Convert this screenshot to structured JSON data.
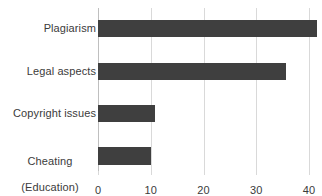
{
  "chart_data": {
    "type": "bar",
    "orientation": "horizontal",
    "title": "",
    "xlabel": "",
    "ylabel": "",
    "categories": [
      "Plagiarism",
      "Legal aspects",
      "Copyright issues",
      "Cheating\n(Education)"
    ],
    "values": [
      41.5,
      35.6,
      10.8,
      10.0
    ],
    "xlim": [
      0,
      40
    ],
    "xticks": [
      0,
      10,
      20,
      30,
      40
    ],
    "xtick_labels": [
      "0",
      "10",
      "20",
      "30",
      "40"
    ],
    "grid": true,
    "grid_axis": "x",
    "legend": false,
    "series": [
      {
        "name": "Count",
        "values": [
          41.5,
          35.6,
          10.8,
          10.0
        ]
      }
    ],
    "colors": {
      "bar_fill": "#3f3f3f",
      "gridline": "#d9d9d9",
      "axis_line": "#bfbfbf",
      "text": "#3b3b3b",
      "background": "#ffffff"
    }
  },
  "labels": {
    "cat0": "Plagiarism",
    "cat1": "Legal aspects",
    "cat2": "Copyright issues",
    "cat3_line1": "Cheating",
    "cat3_line2": "(Education)"
  },
  "ticks": {
    "t0": "0",
    "t1": "10",
    "t2": "20",
    "t3": "30",
    "t4": "40"
  }
}
